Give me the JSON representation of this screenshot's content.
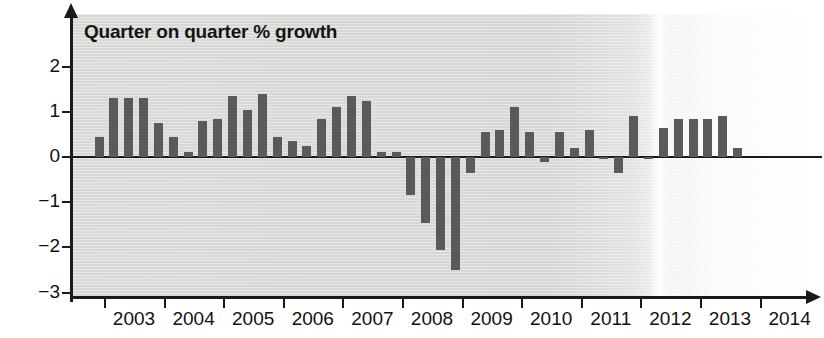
{
  "chart_data": {
    "type": "bar",
    "title": "Quarter on quarter % growth",
    "xlabel": "",
    "ylabel": "",
    "ylim": [
      -3,
      2.6
    ],
    "yticks": [
      2,
      1,
      0,
      -1,
      -2,
      -3
    ],
    "ytick_labels": [
      "2",
      "1",
      "0",
      "−1",
      "−2",
      "−3"
    ],
    "xtick_labels": [
      "2003",
      "2004",
      "2005",
      "2006",
      "2007",
      "2008",
      "2009",
      "2010",
      "2011",
      "2012",
      "2013",
      "2014"
    ],
    "grid": false,
    "legend": false,
    "bar_color": "#5a5a5a",
    "axis_color": "#1a1a1a",
    "plot_background": "#d8d8d6",
    "categories": [
      "2002 Q4",
      "2003 Q1",
      "2003 Q2",
      "2003 Q3",
      "2003 Q4",
      "2004 Q1",
      "2004 Q2",
      "2004 Q3",
      "2004 Q4",
      "2005 Q1",
      "2005 Q2",
      "2005 Q3",
      "2005 Q4",
      "2006 Q1",
      "2006 Q2",
      "2006 Q3",
      "2006 Q4",
      "2007 Q1",
      "2007 Q2",
      "2007 Q3",
      "2007 Q4",
      "2008 Q1",
      "2008 Q2",
      "2008 Q3",
      "2008 Q4",
      "2009 Q1",
      "2009 Q2",
      "2009 Q3",
      "2009 Q4",
      "2010 Q1",
      "2010 Q2",
      "2010 Q3",
      "2010 Q4",
      "2011 Q1",
      "2011 Q2",
      "2011 Q3",
      "2011 Q4",
      "2012 Q1",
      "2012 Q2",
      "2012 Q3",
      "2012 Q4",
      "2013 Q1",
      "2013 Q2",
      "2013 Q3",
      "2013 Q4",
      "2014 Q1"
    ],
    "values": [
      0.45,
      1.3,
      1.3,
      1.3,
      0.75,
      0.45,
      0.1,
      0.8,
      0.85,
      1.35,
      1.05,
      1.4,
      0.45,
      0.35,
      0.25,
      0.85,
      1.1,
      1.35,
      1.25,
      0.1,
      0.1,
      -0.85,
      -1.45,
      -2.05,
      -2.5,
      -0.35,
      0.55,
      0.6,
      1.1,
      0.55,
      -0.1,
      0.55,
      0.2,
      0.6,
      -0.05,
      -0.35,
      0.9,
      -0.05,
      0.65,
      0.85,
      0.85,
      0.85,
      0.9,
      0.2,
      0.0,
      0.0
    ]
  }
}
